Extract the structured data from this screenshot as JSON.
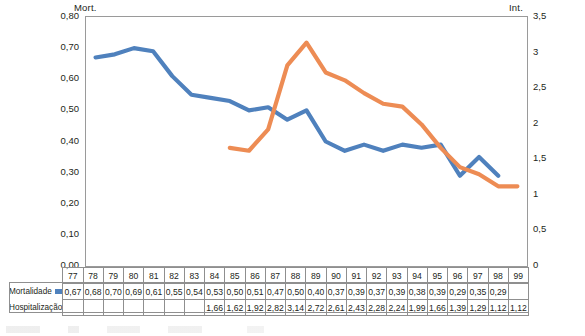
{
  "chart_data": {
    "type": "line",
    "title": "",
    "xlabel": "",
    "categories": [
      "77",
      "78",
      "79",
      "80",
      "81",
      "82",
      "83",
      "84",
      "85",
      "86",
      "87",
      "88",
      "89",
      "90",
      "91",
      "92",
      "93",
      "94",
      "95",
      "96",
      "97",
      "98",
      "99"
    ],
    "series": [
      {
        "name": "Mortalidade",
        "axis": "left",
        "color": "#4f81bd",
        "values": [
          0.67,
          0.68,
          0.7,
          0.69,
          0.61,
          0.55,
          0.54,
          0.53,
          0.5,
          0.51,
          0.47,
          0.5,
          0.4,
          0.37,
          0.39,
          0.37,
          0.39,
          0.38,
          0.39,
          0.29,
          0.35,
          0.29,
          null
        ],
        "labels": [
          "0,67",
          "0,68",
          "0,70",
          "0,69",
          "0,61",
          "0,55",
          "0,54",
          "0,53",
          "0,50",
          "0,51",
          "0,47",
          "0,50",
          "0,40",
          "0,37",
          "0,39",
          "0,37",
          "0,39",
          "0,38",
          "0,39",
          "0,29",
          "0,35",
          "0,29",
          ""
        ]
      },
      {
        "name": "Hospitalização",
        "axis": "right",
        "color": "#ed8c54",
        "values": [
          null,
          null,
          null,
          null,
          null,
          null,
          null,
          1.66,
          1.62,
          1.92,
          2.82,
          3.14,
          2.72,
          2.61,
          2.43,
          2.28,
          2.24,
          1.99,
          1.66,
          1.39,
          1.29,
          1.12,
          1.12
        ],
        "labels": [
          "",
          "",
          "",
          "",
          "",
          "",
          "",
          "1,66",
          "1,62",
          "1,92",
          "2,82",
          "3,14",
          "2,72",
          "2,61",
          "2,43",
          "2,28",
          "2,24",
          "1,99",
          "1,66",
          "1,39",
          "1,29",
          "1,12",
          "1,12"
        ]
      }
    ],
    "left_axis": {
      "caption": "Mort.",
      "min": 0.0,
      "max": 0.8,
      "step": 0.1,
      "ticks": [
        "0,80",
        "0,70",
        "0,60",
        "0,50",
        "0,40",
        "0,30",
        "0,20",
        "0,10",
        "0,00"
      ]
    },
    "right_axis": {
      "caption": "Int.",
      "min": 0,
      "max": 3.5,
      "step": 0.5,
      "ticks": [
        "3,5",
        "3",
        "2,5",
        "2",
        "1,5",
        "1",
        "0,5",
        "0"
      ]
    },
    "grid": false,
    "legend_position": "bottom-table"
  }
}
